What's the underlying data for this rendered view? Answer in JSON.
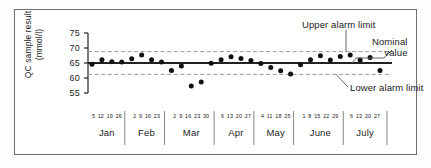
{
  "chart_data": {
    "type": "scatter",
    "title": "",
    "xlabel": "",
    "ylabel": "QC sample result (mmol/l)",
    "ylabel_line1": "QC sample result",
    "ylabel_line2": "(mmol/l)",
    "ylim": [
      55,
      75
    ],
    "yticks": [
      55,
      60,
      65,
      70,
      75
    ],
    "grid": false,
    "legend": "none",
    "nominal_value": 65,
    "upper_alarm_limit": 68.8,
    "lower_alarm_limit": 61.2,
    "months": [
      {
        "name": "Jan",
        "days": [
          "5",
          "12",
          "19",
          "26"
        ]
      },
      {
        "name": "Feb",
        "days": [
          "2",
          "9",
          "16",
          "23"
        ]
      },
      {
        "name": "Mar",
        "days": [
          "2",
          "9",
          "16",
          "23",
          "30"
        ]
      },
      {
        "name": "Apr",
        "days": [
          "6",
          "13",
          "20",
          "27"
        ]
      },
      {
        "name": "May",
        "days": [
          "4",
          "11",
          "18",
          "25"
        ]
      },
      {
        "name": "June",
        "days": [
          "1",
          "8",
          "15",
          "22",
          "29"
        ]
      },
      {
        "name": "July",
        "days": [
          "6",
          "13",
          "20",
          "27"
        ]
      }
    ],
    "x": [
      "5 Jan",
      "12 Jan",
      "19 Jan",
      "26 Jan",
      "2 Feb",
      "9 Feb",
      "16 Feb",
      "23 Feb",
      "2 Mar",
      "9 Mar",
      "16 Mar",
      "23 Mar",
      "30 Mar",
      "6 Apr",
      "13 Apr",
      "20 Apr",
      "27 Apr",
      "4 May",
      "11 May",
      "18 May",
      "25 May",
      "1 June",
      "8 June",
      "15 June",
      "22 June",
      "29 June",
      "6 July",
      "13 July",
      "20 July",
      "27 July"
    ],
    "values": [
      64.6,
      66.1,
      65.4,
      65.3,
      66.4,
      67.7,
      66.1,
      65.3,
      62.5,
      64.0,
      57.3,
      58.7,
      64.9,
      66.1,
      67.1,
      66.5,
      65.8,
      64.8,
      63.5,
      62.4,
      61.3,
      64.4,
      66.1,
      67.4,
      66.0,
      67.2,
      67.7,
      66.0,
      66.8,
      62.5
    ],
    "annotations": [
      {
        "id": "upper-alarm-limit",
        "text": "Upper alarm limit"
      },
      {
        "id": "nominal-value",
        "text": "Nominal value",
        "line1": "Nominal",
        "line2": "value"
      },
      {
        "id": "lower-alarm-limit",
        "text": "Lower alarm limit"
      }
    ]
  },
  "style": {
    "point_color": "#111111",
    "nominal_color": "#222222",
    "limit_color": "#9a9a9a",
    "axis_color": "#222222",
    "frame_color": "#6e6e6e"
  }
}
